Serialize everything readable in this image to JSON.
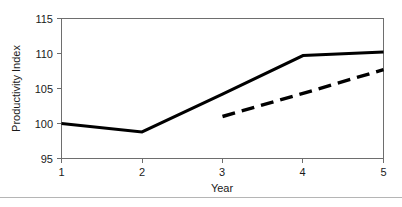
{
  "chart_data": {
    "type": "line",
    "title": "",
    "xlabel": "Year",
    "ylabel": "Productivity Index",
    "x": [
      1,
      2,
      3,
      4,
      5
    ],
    "xlim": [
      1,
      5
    ],
    "ylim": [
      95,
      115
    ],
    "xticks": [
      "1",
      "2",
      "3",
      "4",
      "5"
    ],
    "yticks": [
      "95",
      "100",
      "105",
      "110",
      "115"
    ],
    "grid": false,
    "legend": "none",
    "series": [
      {
        "name": "solid-series",
        "style": "solid",
        "color": "#000000",
        "x": [
          1,
          2,
          3,
          4,
          5
        ],
        "values": [
          100.0,
          98.8,
          104.2,
          109.7,
          110.2
        ]
      },
      {
        "name": "dashed-series",
        "style": "dashed",
        "color": "#000000",
        "x": [
          3,
          4,
          5
        ],
        "values": [
          101.0,
          104.3,
          107.7
        ]
      }
    ]
  },
  "axes": {
    "y_title": "Productivity Index",
    "x_title": "Year",
    "y_tick_labels": [
      "115",
      "110",
      "105",
      "100",
      "95"
    ],
    "x_tick_labels": [
      "1",
      "2",
      "3",
      "4",
      "5"
    ]
  },
  "colors": {
    "line": "#000000",
    "axis": "#6e6e6e",
    "text": "#1a1a1a",
    "background": "#ffffff",
    "footer_rule": "#b5b5b5"
  }
}
